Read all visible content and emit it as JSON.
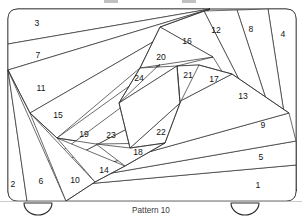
{
  "figure": {
    "caption": "Pattern 10",
    "title": "Pattern 10",
    "colors": {
      "background": "#ffffff",
      "piece_fill": "#ffffff",
      "stroke": "#2b2b2b",
      "label_text": "#141414",
      "caption_text": "#3a3a3a",
      "baseline": "#bdbdbd"
    },
    "outer_shape": "rounded-rectangle",
    "corner_radius": 12,
    "piece_count": 24
  },
  "pieces": [
    {
      "number": "1",
      "label_x": 258,
      "label_y": 186
    },
    {
      "number": "2",
      "label_x": 13,
      "label_y": 185
    },
    {
      "number": "3",
      "label_x": 37,
      "label_y": 24
    },
    {
      "number": "4",
      "label_x": 283,
      "label_y": 35
    },
    {
      "number": "5",
      "label_x": 261,
      "label_y": 158
    },
    {
      "number": "6",
      "label_x": 41,
      "label_y": 182
    },
    {
      "number": "7",
      "label_x": 38,
      "label_y": 56
    },
    {
      "number": "8",
      "label_x": 251,
      "label_y": 30
    },
    {
      "number": "9",
      "label_x": 263,
      "label_y": 126
    },
    {
      "number": "10",
      "label_x": 75,
      "label_y": 181
    },
    {
      "number": "11",
      "label_x": 41,
      "label_y": 89
    },
    {
      "number": "12",
      "label_x": 216,
      "label_y": 31
    },
    {
      "number": "13",
      "label_x": 243,
      "label_y": 97
    },
    {
      "number": "14",
      "label_x": 104,
      "label_y": 171
    },
    {
      "number": "15",
      "label_x": 58,
      "label_y": 116
    },
    {
      "number": "16",
      "label_x": 187,
      "label_y": 42
    },
    {
      "number": "17",
      "label_x": 214,
      "label_y": 80
    },
    {
      "number": "18",
      "label_x": 138,
      "label_y": 153
    },
    {
      "number": "19",
      "label_x": 84,
      "label_y": 135
    },
    {
      "number": "20",
      "label_x": 161,
      "label_y": 58
    },
    {
      "number": "21",
      "label_x": 188,
      "label_y": 76
    },
    {
      "number": "22",
      "label_x": 161,
      "label_y": 133
    },
    {
      "number": "23",
      "label_x": 111,
      "label_y": 136
    },
    {
      "number": "24",
      "label_x": 139,
      "label_y": 79
    }
  ],
  "handles": [
    {
      "name": "tab-handle-left",
      "cx": 38,
      "cy": 206
    },
    {
      "name": "tab-handle-right",
      "cx": 245,
      "cy": 206
    }
  ]
}
